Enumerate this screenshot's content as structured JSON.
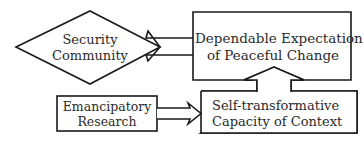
{
  "diagram": {
    "type": "flow-diagram",
    "nodes": {
      "security_community": {
        "shape": "diamond",
        "lines": [
          "Security",
          "Community"
        ]
      },
      "dependable_expectations": {
        "shape": "rectangle",
        "lines": [
          "Dependable Expectations",
          "of Peaceful Change"
        ]
      },
      "emancipatory_research": {
        "shape": "rectangle",
        "lines": [
          "Emancipatory",
          "Research"
        ]
      },
      "self_transformative": {
        "shape": "rectangle",
        "lines": [
          "Self-transformative",
          "Capacity of Context"
        ]
      }
    },
    "edges": [
      {
        "from": "Dependable Expectations of Peaceful Change",
        "to": "Security Community",
        "style": "double-line arrow"
      },
      {
        "from": "Self-transformative Capacity of Context",
        "to": "Dependable Expectations of Peaceful Change",
        "style": "double-line arrow"
      },
      {
        "from": "Emancipatory Research",
        "to": "Self-transformative Capacity of Context",
        "style": "double-line arrow"
      }
    ],
    "colors": {
      "stroke": "#1a1a1a",
      "fill": "#ffffff",
      "text": "#2a2a2a"
    }
  }
}
